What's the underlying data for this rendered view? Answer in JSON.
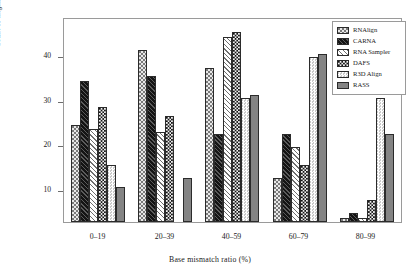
{
  "chart_data": {
    "type": "bar",
    "title": "",
    "xlabel": "Base  mismatch ratio (%)",
    "ylabel": "Count of alignments",
    "categories": [
      "0–19",
      "20–39",
      "40–59",
      "60–79",
      "80–99"
    ],
    "ylim": [
      0,
      46
    ],
    "yticks": [
      10,
      20,
      30,
      40
    ],
    "grid": false,
    "legend_position": "top-right",
    "series": [
      {
        "name": "RNAlign",
        "pattern": "dotted-light",
        "values": [
          22,
          39,
          35,
          10,
          1
        ]
      },
      {
        "name": "CARNA",
        "pattern": "solid-black",
        "values": [
          32,
          33,
          20,
          20,
          2
        ]
      },
      {
        "name": "RNA Sampler",
        "pattern": "diagonal-hatch",
        "values": [
          21,
          20.5,
          42,
          17,
          1
        ]
      },
      {
        "name": "DAFS",
        "pattern": "checker-dark",
        "values": [
          26,
          24,
          43,
          13,
          5
        ]
      },
      {
        "name": "R3D Align",
        "pattern": "checker-light",
        "values": [
          13,
          0,
          28,
          37.5,
          28
        ]
      },
      {
        "name": "RASS",
        "pattern": "solid-gray",
        "values": [
          8,
          10,
          28.7,
          38,
          20
        ]
      }
    ]
  },
  "axis": {
    "y_title": "Count of alignments",
    "x_title": "Base  mismatch ratio (%)",
    "y_ticks": [
      "40",
      "30",
      "20",
      "10"
    ],
    "x_ticks": [
      "0–19",
      "20–39",
      "40–59",
      "60–79",
      "80–99"
    ]
  },
  "legend": {
    "items": [
      {
        "label": "RNAlign"
      },
      {
        "label": "CARNA"
      },
      {
        "label": "RNA Sampler"
      },
      {
        "label": "DAFS"
      },
      {
        "label": "R3D Align"
      },
      {
        "label": "RASS"
      }
    ]
  },
  "colors": {
    "frame": "#9a9a9a",
    "bar_outline": "#2b2b2b",
    "carna": "#141414",
    "dafs": "#1a1a1a",
    "rass": "#848484",
    "r3dalign": "#f0f0f0",
    "rnalign": "#e8e8e8"
  }
}
